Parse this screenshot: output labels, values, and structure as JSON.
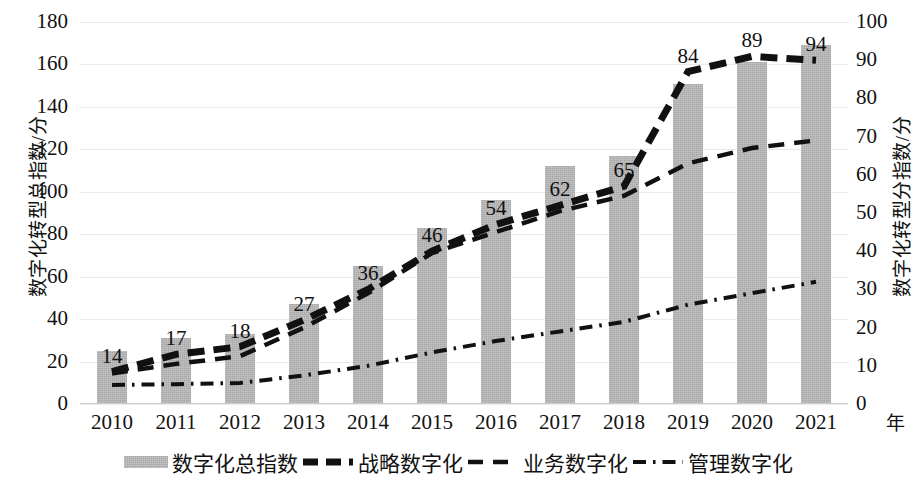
{
  "chart_data": {
    "type": "bar",
    "title": "",
    "xlabel": "年",
    "ylabel": "数字化转型总指数/分",
    "ylabel_secondary": "数字化转型分指数/分",
    "categories": [
      "2010",
      "2011",
      "2012",
      "2013",
      "2014",
      "2015",
      "2016",
      "2017",
      "2018",
      "2019",
      "2020",
      "2021"
    ],
    "ylim": [
      0,
      180
    ],
    "ylim_secondary": [
      0,
      100
    ],
    "yticks": [
      "0",
      "20",
      "40",
      "60",
      "80",
      "100",
      "120",
      "140",
      "160",
      "180"
    ],
    "yticks_secondary": [
      "0",
      "10",
      "20",
      "30",
      "40",
      "50",
      "60",
      "70",
      "80",
      "90",
      "100"
    ],
    "grid": true,
    "legend_position": "bottom",
    "bar_color": "#a8a8a8",
    "line_color": "#111111",
    "series": [
      {
        "name": "数字化总指数",
        "kind": "bar",
        "axis": "left",
        "values": [
          25,
          31,
          33,
          47,
          65,
          83,
          96,
          112,
          117,
          151,
          161,
          169
        ]
      },
      {
        "name": "战略数字化",
        "kind": "line",
        "style": "thick-dashed",
        "axis": "right",
        "values": [
          8.5,
          13,
          15,
          22,
          30,
          40,
          47,
          52,
          57,
          87,
          91,
          90
        ],
        "data_labels": [
          "14",
          "17",
          "18",
          "27",
          "36",
          "46",
          "54",
          "62",
          "65",
          "84",
          "89",
          "94"
        ]
      },
      {
        "name": "业务数字化",
        "kind": "line",
        "style": "dashed",
        "axis": "right",
        "values": [
          8,
          10.5,
          12.5,
          20,
          29,
          39.5,
          45,
          50.5,
          54.5,
          63,
          67,
          69
        ]
      },
      {
        "name": "管理数字化",
        "kind": "line",
        "style": "dash-dot",
        "axis": "right",
        "values": [
          5,
          5.2,
          5.5,
          7.5,
          10,
          13.5,
          16.5,
          19,
          21.5,
          26,
          29,
          32
        ]
      }
    ]
  },
  "legend": {
    "items": [
      {
        "label": "数字化总指数",
        "marker": "bar-swatch"
      },
      {
        "label": "战略数字化",
        "marker": "thick-dash-line"
      },
      {
        "label": "业务数字化",
        "marker": "dash-line"
      },
      {
        "label": "管理数字化",
        "marker": "dash-dot-line"
      }
    ]
  }
}
